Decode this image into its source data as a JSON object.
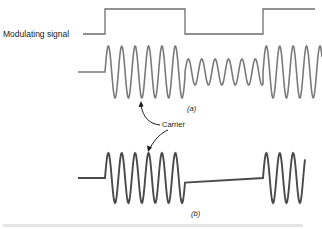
{
  "figure": {
    "labels": {
      "modulating_signal": "Modulating signal",
      "carrier": "Carrier",
      "panel_a": "(a)",
      "panel_b": "(b)"
    },
    "colors": {
      "signal_line": "#6e6e6e",
      "wave_a": "#7a7a7a",
      "wave_b": "#4a4a4a",
      "text": "#1a1a1a",
      "background": "#ffffff"
    },
    "modulating_signal": {
      "levels": [
        "low",
        "high",
        "low",
        "high"
      ],
      "transitions_x": [
        105,
        185,
        263
      ]
    },
    "waveform_a": {
      "description": "Amplitude-modulated carrier: full amplitude when signal high, reduced amplitude when signal low",
      "segments": [
        {
          "state": "idle",
          "x_start": 78,
          "x_end": 105
        },
        {
          "state": "full",
          "x_start": 105,
          "x_end": 185
        },
        {
          "state": "reduced",
          "x_start": 185,
          "x_end": 263
        },
        {
          "state": "full",
          "x_start": 263,
          "x_end": 322
        }
      ]
    },
    "waveform_b": {
      "description": "On-off keyed carrier: carrier present when signal high, absent when signal low",
      "segments": [
        {
          "state": "idle",
          "x_start": 78,
          "x_end": 105
        },
        {
          "state": "on",
          "x_start": 105,
          "x_end": 185
        },
        {
          "state": "off",
          "x_start": 185,
          "x_end": 263
        },
        {
          "state": "on",
          "x_start": 263,
          "x_end": 305
        }
      ]
    }
  }
}
